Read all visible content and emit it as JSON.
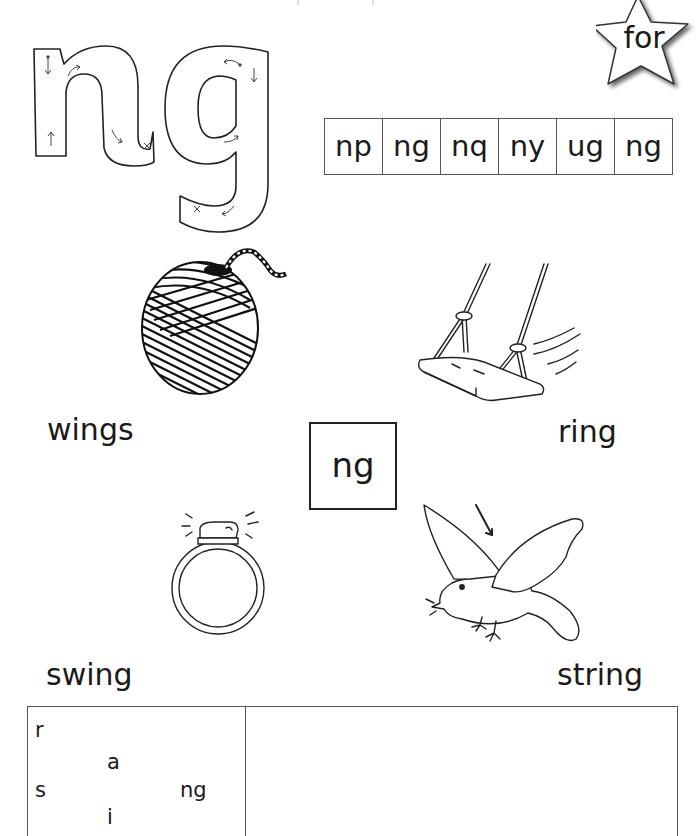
{
  "worksheet": {
    "focus_grapheme": "ng",
    "big_letters": {
      "text": "ng",
      "style": "outline letter formation with directional arrows",
      "icon": "letter-formation-outline"
    },
    "star": {
      "label": "for",
      "icon": "star-icon"
    },
    "letter_choices": [
      "np",
      "ng",
      "nq",
      "ny",
      "ug",
      "ng"
    ],
    "center_box": {
      "label": "ng"
    },
    "pictures": [
      {
        "name": "ball-of-string",
        "icon": "ball-of-string-icon"
      },
      {
        "name": "swing",
        "icon": "swing-icon"
      },
      {
        "name": "ring",
        "icon": "ring-icon"
      },
      {
        "name": "bird-with-wings",
        "icon": "bird-icon"
      }
    ],
    "words": {
      "top_left": "wings",
      "top_right": "ring",
      "bottom_left": "swing",
      "bottom_right": "string"
    },
    "blending_box": {
      "onsets": [
        "r",
        "s"
      ],
      "vowels": [
        "a",
        "i"
      ],
      "ending": "ng"
    },
    "writing_area": {
      "value": ""
    }
  }
}
